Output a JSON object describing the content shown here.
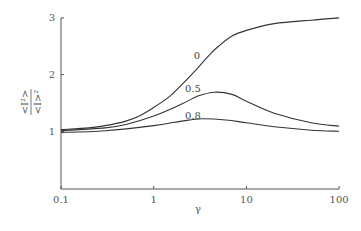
{
  "chart_data": {
    "type": "line",
    "title": "",
    "xlabel": "γ",
    "ylabel": "<I²>/<I>²",
    "ylabel_numerator": "<I²>",
    "ylabel_denominator": "<I>²",
    "xscale": "log",
    "xlim": [
      0.1,
      100
    ],
    "ylim": [
      0,
      3
    ],
    "x_ticks": [
      "0.1",
      "1",
      "10",
      "100"
    ],
    "y_ticks": [
      "1",
      "2",
      "3"
    ],
    "grid": false,
    "legend": "inline curve labels",
    "series": [
      {
        "name": "0",
        "x": [
          0.1,
          0.2,
          0.3,
          0.5,
          0.7,
          1,
          1.5,
          2,
          3,
          4,
          5,
          7,
          10,
          20,
          50,
          100
        ],
        "y": [
          1.03,
          1.06,
          1.1,
          1.18,
          1.27,
          1.42,
          1.62,
          1.82,
          2.12,
          2.35,
          2.5,
          2.68,
          2.78,
          2.9,
          2.96,
          3.0
        ],
        "label_pos": {
          "x": 197,
          "y": 59
        }
      },
      {
        "name": "0.5",
        "x": [
          0.1,
          0.3,
          0.5,
          1,
          2,
          3,
          4.5,
          7,
          10,
          20,
          50,
          100
        ],
        "y": [
          1.01,
          1.06,
          1.12,
          1.27,
          1.48,
          1.62,
          1.69,
          1.65,
          1.53,
          1.32,
          1.15,
          1.09
        ],
        "label_pos": {
          "x": 193,
          "y": 92
        }
      },
      {
        "name": "0.8",
        "x": [
          0.1,
          0.3,
          1,
          2,
          3.3,
          6,
          10,
          20,
          50,
          100
        ],
        "y": [
          0.98,
          1.01,
          1.1,
          1.18,
          1.22,
          1.2,
          1.15,
          1.08,
          1.02,
          1.0
        ],
        "label_pos": {
          "x": 193,
          "y": 119
        }
      }
    ]
  }
}
